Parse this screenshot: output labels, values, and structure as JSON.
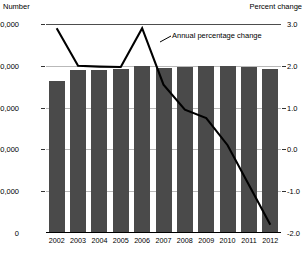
{
  "axis_titles": {
    "left": "Number",
    "right": "Percent change"
  },
  "annotation": {
    "label": "Annual percentage change"
  },
  "chart_data": {
    "type": "bar",
    "title": "",
    "subtitle": "",
    "xlabel": "",
    "ylabel": "Number",
    "y2label": "Percent change",
    "grid": true,
    "legend_position": "inline-annotation",
    "categories": [
      "2002",
      "2003",
      "2004",
      "2005",
      "2006",
      "2007",
      "2008",
      "2009",
      "2010",
      "2011",
      "2012"
    ],
    "left_axis": {
      "label": "Number",
      "ticks": [
        "0",
        "400,000",
        "800,000",
        "1,200,000",
        "1,600,000",
        "2,000,000"
      ],
      "tick_values": [
        0,
        400000,
        800000,
        1200000,
        1600000,
        2000000
      ],
      "ylim": [
        0,
        2000000
      ]
    },
    "right_axis": {
      "label": "Percent change",
      "ticks": [
        "-2.0",
        "-1.0",
        "0.0",
        "1.0",
        "2.0",
        "3.0"
      ],
      "tick_values": [
        -2.0,
        -1.0,
        0.0,
        1.0,
        2.0,
        3.0
      ],
      "ylim": [
        -2.0,
        3.0
      ]
    },
    "series": [
      {
        "name": "Number",
        "type": "bar",
        "axis": "left",
        "color": "#4a4a4a",
        "values": [
          1450000,
          1560000,
          1560000,
          1570000,
          1600000,
          1575000,
          1590000,
          1600000,
          1595000,
          1585000,
          1570000
        ]
      },
      {
        "name": "Annual percentage change",
        "type": "line",
        "axis": "right",
        "color": "#000000",
        "values": [
          2.9,
          2.0,
          1.98,
          1.97,
          2.9,
          1.55,
          0.95,
          0.75,
          0.1,
          -0.85,
          -1.8
        ]
      }
    ]
  }
}
